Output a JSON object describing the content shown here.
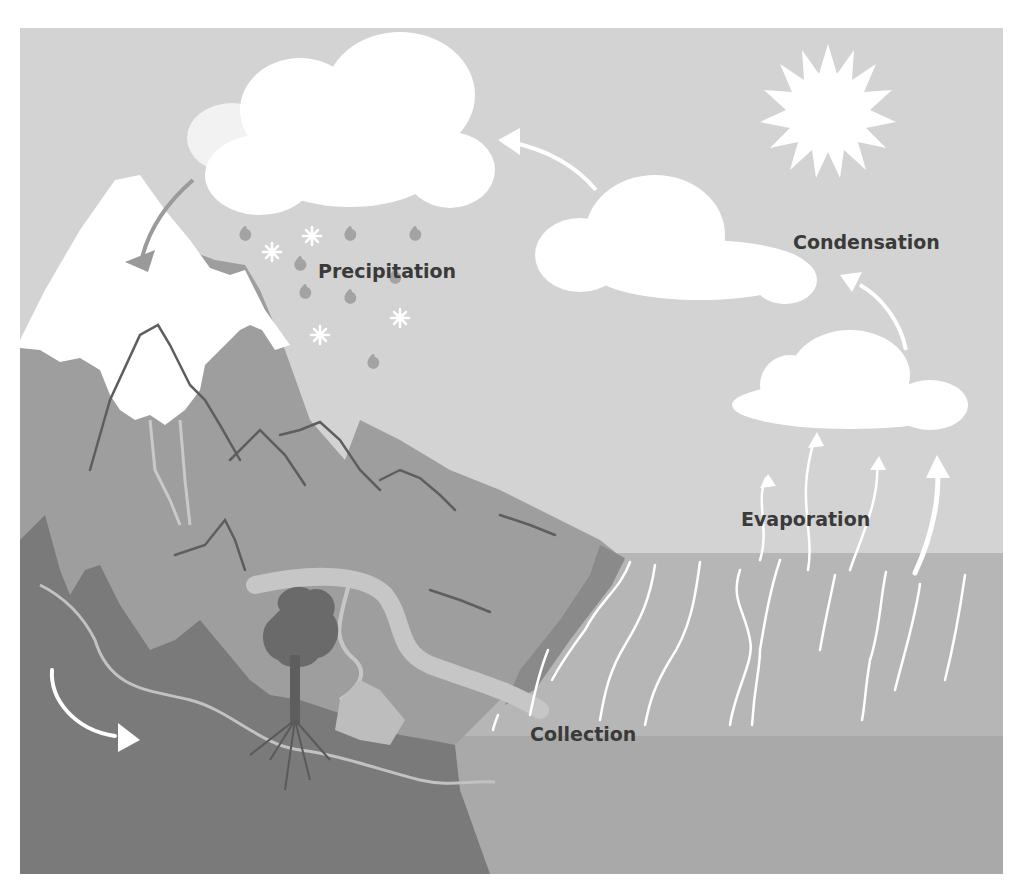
{
  "diagram": {
    "labels": {
      "precipitation": "Precipitation",
      "condensation": "Condensation",
      "evaporation": "Evaporation",
      "collection": "Collection"
    },
    "elements": [
      "sun",
      "clouds",
      "snowy-mountains",
      "rain-drops",
      "snowflakes",
      "river",
      "tree",
      "ocean",
      "groundwater-flow",
      "evaporation-wisps"
    ],
    "colors": {
      "sky": "#d3d3d3",
      "cloud": "#ffffff",
      "sun": "#ffffff",
      "snow": "#ffffff",
      "mountain": "#9e9e9e",
      "mountain_dark": "#878787",
      "ground": "#7a7a7a",
      "river": "#c6c6c6",
      "sea_upper": "#b6b6b6",
      "sea_lower": "#a9a9a9",
      "tree": "#6a6a6a",
      "label_text": "#3a3a3a",
      "drop": "#a3a3a3",
      "arrow_gray": "#9a9a9a"
    }
  }
}
